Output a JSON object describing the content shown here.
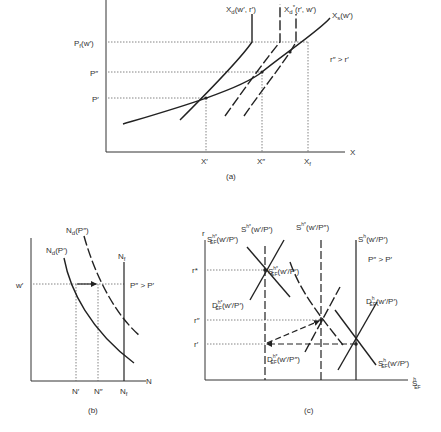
{
  "panel_a": {
    "caption": "(a)",
    "y_ticks": {
      "pf": "P",
      "pf_sub": "f",
      "pf_arg": "(w′)",
      "p2": "P″",
      "p1": "P′"
    },
    "x_ticks": {
      "x1": "X′",
      "x2": "X″",
      "xf": "X",
      "xf_sub": "f"
    },
    "x_axis": "X",
    "curves": {
      "xd": "X",
      "xd_sub": "d",
      "xd_arg": "(w′, r′)",
      "xd_star": "X",
      "xd_star_sub": "d",
      "xd_star_sup": "*",
      "xd_star_arg": "(r′, w′)",
      "xs": "X",
      "xs_sub": "s",
      "xs_arg": "(w′)"
    },
    "note": "r″ > r′"
  },
  "panel_b": {
    "caption": "(b)",
    "y_tick": "w′",
    "x_ticks": {
      "n1": "N′",
      "n2": "N″",
      "nf": "N",
      "nf_sub": "f"
    },
    "x_axis": "N",
    "curves": {
      "nd2": "N",
      "nd2_sub": "d",
      "nd2_arg": "(P″)",
      "nd1": "N",
      "nd1_sub": "d",
      "nd1_arg": "(P′)",
      "nf": "N",
      "nf_sub": "f"
    },
    "note": "P″ > P′"
  },
  "panel_c": {
    "caption": "(c)",
    "y_axis": "r",
    "y_ticks": {
      "rstar": "r*",
      "r2": "r″",
      "r1": "r′"
    },
    "x_axis": "S",
    "x_axis_sub": "EF",
    "x_axis_sup": "h",
    "labels": {
      "sh_star_p1": "S",
      "sh_star_p1_sup": "h*",
      "sh_star_p1_arg": "(w′/P′)",
      "sh_star_p2": "S",
      "sh_star_p2_sup": "h*",
      "sh_star_p2_arg": "(w′/P″)",
      "sh_p1": "S",
      "sh_p1_sup": "h",
      "sh_p1_arg": "(w′/P′)",
      "sef_star_top": "S",
      "sef_star_top_sub": "EF",
      "sef_star_top_sup": "h*",
      "sef_star_top_arg": "(w′/P′)",
      "sef_star_mid": "S",
      "sef_star_mid_sub": "EF",
      "sef_star_mid_sup": "h*",
      "sef_star_mid_arg": "(w′/P′)",
      "def_star_mid": "D",
      "def_star_mid_sub": "EF",
      "def_star_mid_sup": "h*",
      "def_star_mid_arg": "(w′/P′)",
      "def_star_low": "D",
      "def_star_low_sub": "EF",
      "def_star_low_sup": "h*",
      "def_star_low_arg": "(w′/P″)",
      "def_h": "D",
      "def_h_sub": "EF",
      "def_h_sup": "h",
      "def_h_arg": "(w′/P′)",
      "sef_h": "S",
      "sef_h_sub": "EF",
      "sef_h_sup": "h",
      "sef_h_arg": "(w′/P′)"
    },
    "note": "P″ > P′"
  },
  "colors": {
    "line": "#222222",
    "dotted": "#555555",
    "text": "#333333",
    "background": "#ffffff"
  }
}
